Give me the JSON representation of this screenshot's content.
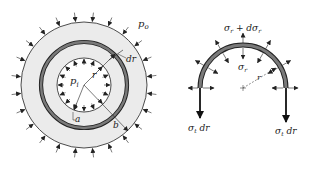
{
  "figure": {
    "left_panel": {
      "description": "Thick-walled cylinder cross-section under internal and external pressure",
      "labels": {
        "outer_pressure": "p",
        "outer_pressure_sub": "o",
        "inner_pressure": "p",
        "inner_pressure_sub": "i",
        "radius": "r",
        "ring_thickness": "dr",
        "inner_radius": "a",
        "outer_radius": "b"
      },
      "geometry": {
        "cx": 84,
        "cy": 85,
        "outer_r": 63,
        "ring_r": 43,
        "inner_r": 27
      }
    },
    "right_panel": {
      "description": "Free-body diagram of half ring element",
      "labels": {
        "outer_stress": "σ",
        "outer_stress_sub": "r",
        "outer_stress_plus": " + dσ",
        "outer_stress_plus_sub": "r",
        "inner_stress": "σ",
        "inner_stress_sub": "r",
        "radius": "r",
        "left_force": "σ",
        "left_force_sub": "t",
        "left_force_suffix": " dr",
        "right_force": "σ",
        "right_force_sub": "t",
        "right_force_suffix": " dr"
      },
      "geometry": {
        "cx": 243,
        "cy": 88,
        "r": 41
      }
    },
    "colors": {
      "ring_fill": "#e6e6e6",
      "ring_band": "#7a7a7a",
      "stroke": "#222222"
    }
  }
}
